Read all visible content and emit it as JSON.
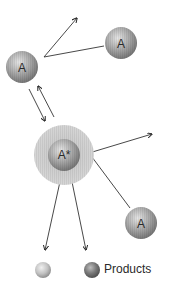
{
  "diagram": {
    "molecules": [
      {
        "id": "a1",
        "label": "A",
        "cx": 22,
        "cy": 67,
        "r": 16
      },
      {
        "id": "a2",
        "label": "A",
        "cx": 121,
        "cy": 43,
        "r": 16
      },
      {
        "id": "astar",
        "label": "A*",
        "cx": 64,
        "cy": 155,
        "r": 16,
        "halo_r": 30
      },
      {
        "id": "a3",
        "label": "A",
        "cx": 141,
        "cy": 223,
        "r": 16
      }
    ],
    "products": [
      {
        "id": "p1",
        "cx": 43,
        "cy": 270,
        "r": 8,
        "shade": "light"
      },
      {
        "id": "p2",
        "cx": 92,
        "cy": 270,
        "r": 8,
        "shade": "dark"
      }
    ],
    "products_label": "Products",
    "colors": {
      "sphere_light": "#e0e0e0",
      "sphere_mid": "#a8a8a8",
      "sphere_dark": "#6e6e6e",
      "halo": "#c9c9c9",
      "line": "#333333",
      "text": "#2a2a2a"
    }
  }
}
